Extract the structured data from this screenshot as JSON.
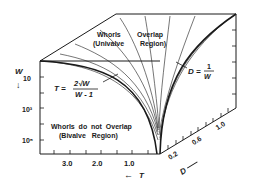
{
  "figure": {
    "top_region_label": {
      "line1_left": "Whorls",
      "line1_right": "Overlap",
      "line2_left": "(Univalve",
      "line2_right": "Region)"
    },
    "bottom_region_label": {
      "line1": "Whorls  do  not  Overlap",
      "line2": "(Bivalve   Region)"
    },
    "equation_T": {
      "lhs": "T =",
      "numerator": "2√W",
      "denominator": "W - 1"
    },
    "equation_D": {
      "lhs": "D =",
      "numerator": "1",
      "denominator": "W"
    },
    "axis_W": {
      "label": "W",
      "arrow": "↓",
      "ticks": [
        "10",
        "10³",
        "10⁵"
      ]
    },
    "axis_T": {
      "label": "T",
      "arrow": "←",
      "ticks": [
        "3.0",
        "2.0",
        "1.0"
      ]
    },
    "axis_D": {
      "label": "D",
      "ticks": [
        "0.2",
        "0.6",
        "1.0"
      ]
    }
  },
  "colors": {
    "ink": "#1a1a1a",
    "background": "#ffffff"
  }
}
